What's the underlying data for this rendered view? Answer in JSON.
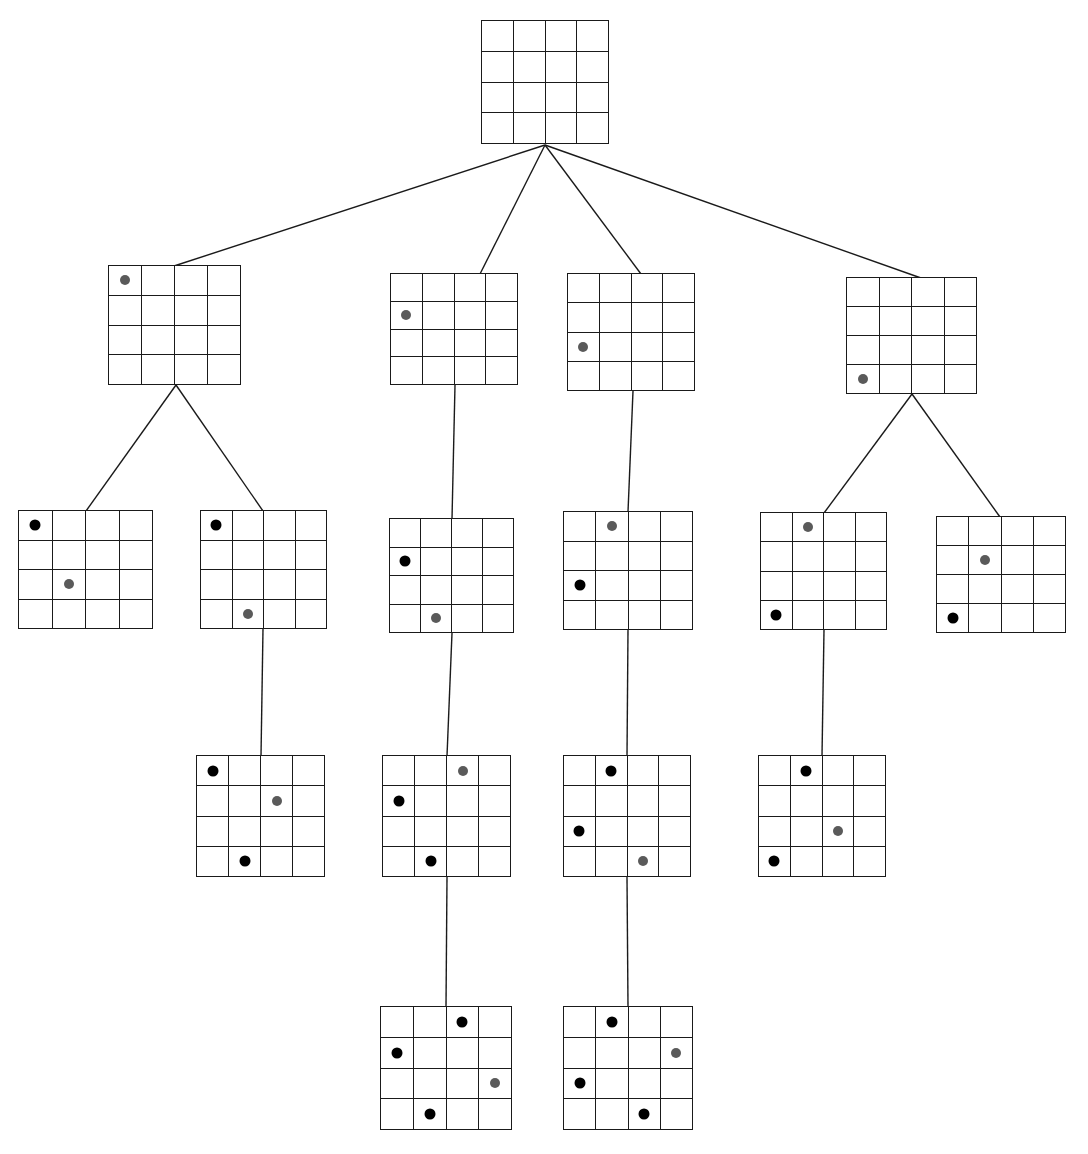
{
  "diagram": {
    "board_rows": 4,
    "board_cols": 4,
    "colors": {
      "grid_line": "#1a1a1a",
      "background": "#ffffff",
      "edge_line": "#1a1a1a",
      "placed_piece": "#000000",
      "candidate_piece": "#5a5a5a"
    },
    "legend": {
      "placed_label": "placed piece",
      "candidate_label": "newly placed piece"
    }
  },
  "chart_data": {
    "type": "diagram",
    "levels": 5,
    "node_count": 17,
    "edge_count": 16
  },
  "nodes": [
    {
      "id": "root",
      "level": 0,
      "x": 481,
      "y": 20,
      "w": 128,
      "h": 124,
      "pieces": []
    },
    {
      "id": "L1-A",
      "level": 1,
      "x": 108,
      "y": 265,
      "w": 133,
      "h": 120,
      "pieces": [
        {
          "row": 1,
          "col": 1,
          "kind": "candidate"
        }
      ]
    },
    {
      "id": "L1-B",
      "level": 1,
      "x": 390,
      "y": 273,
      "w": 128,
      "h": 112,
      "pieces": [
        {
          "row": 2,
          "col": 1,
          "kind": "candidate"
        }
      ]
    },
    {
      "id": "L1-C",
      "level": 1,
      "x": 567,
      "y": 273,
      "w": 128,
      "h": 118,
      "pieces": [
        {
          "row": 3,
          "col": 1,
          "kind": "candidate"
        }
      ]
    },
    {
      "id": "L1-D",
      "level": 1,
      "x": 846,
      "y": 277,
      "w": 131,
      "h": 117,
      "pieces": [
        {
          "row": 4,
          "col": 1,
          "kind": "candidate"
        }
      ]
    },
    {
      "id": "L2-A",
      "level": 2,
      "x": 18,
      "y": 510,
      "w": 135,
      "h": 119,
      "pieces": [
        {
          "row": 1,
          "col": 1,
          "kind": "placed"
        },
        {
          "row": 3,
          "col": 2,
          "kind": "candidate"
        }
      ]
    },
    {
      "id": "L2-B",
      "level": 2,
      "x": 200,
      "y": 510,
      "w": 127,
      "h": 119,
      "pieces": [
        {
          "row": 1,
          "col": 1,
          "kind": "placed"
        },
        {
          "row": 4,
          "col": 2,
          "kind": "candidate"
        }
      ]
    },
    {
      "id": "L2-C",
      "level": 2,
      "x": 389,
      "y": 518,
      "w": 125,
      "h": 115,
      "pieces": [
        {
          "row": 2,
          "col": 1,
          "kind": "placed"
        },
        {
          "row": 4,
          "col": 2,
          "kind": "candidate"
        }
      ]
    },
    {
      "id": "L2-D",
      "level": 2,
      "x": 563,
      "y": 511,
      "w": 130,
      "h": 119,
      "pieces": [
        {
          "row": 1,
          "col": 2,
          "kind": "candidate"
        },
        {
          "row": 3,
          "col": 1,
          "kind": "placed"
        }
      ]
    },
    {
      "id": "L2-E",
      "level": 2,
      "x": 760,
      "y": 512,
      "w": 127,
      "h": 118,
      "pieces": [
        {
          "row": 1,
          "col": 2,
          "kind": "candidate"
        },
        {
          "row": 4,
          "col": 1,
          "kind": "placed"
        }
      ]
    },
    {
      "id": "L2-F",
      "level": 2,
      "x": 936,
      "y": 516,
      "w": 130,
      "h": 117,
      "pieces": [
        {
          "row": 2,
          "col": 2,
          "kind": "candidate"
        },
        {
          "row": 4,
          "col": 1,
          "kind": "placed"
        }
      ]
    },
    {
      "id": "L3-A",
      "level": 3,
      "x": 196,
      "y": 755,
      "w": 129,
      "h": 122,
      "pieces": [
        {
          "row": 1,
          "col": 1,
          "kind": "placed"
        },
        {
          "row": 2,
          "col": 3,
          "kind": "candidate"
        },
        {
          "row": 4,
          "col": 2,
          "kind": "placed"
        }
      ]
    },
    {
      "id": "L3-B",
      "level": 3,
      "x": 382,
      "y": 755,
      "w": 129,
      "h": 122,
      "pieces": [
        {
          "row": 1,
          "col": 3,
          "kind": "candidate"
        },
        {
          "row": 2,
          "col": 1,
          "kind": "placed"
        },
        {
          "row": 4,
          "col": 2,
          "kind": "placed"
        }
      ]
    },
    {
      "id": "L3-C",
      "level": 3,
      "x": 563,
      "y": 755,
      "w": 128,
      "h": 122,
      "pieces": [
        {
          "row": 1,
          "col": 2,
          "kind": "placed"
        },
        {
          "row": 3,
          "col": 1,
          "kind": "placed"
        },
        {
          "row": 4,
          "col": 3,
          "kind": "candidate"
        }
      ]
    },
    {
      "id": "L3-D",
      "level": 3,
      "x": 758,
      "y": 755,
      "w": 128,
      "h": 122,
      "pieces": [
        {
          "row": 1,
          "col": 2,
          "kind": "placed"
        },
        {
          "row": 3,
          "col": 3,
          "kind": "candidate"
        },
        {
          "row": 4,
          "col": 1,
          "kind": "placed"
        }
      ]
    },
    {
      "id": "L4-A",
      "level": 4,
      "x": 380,
      "y": 1006,
      "w": 132,
      "h": 124,
      "pieces": [
        {
          "row": 1,
          "col": 3,
          "kind": "placed"
        },
        {
          "row": 2,
          "col": 1,
          "kind": "placed"
        },
        {
          "row": 3,
          "col": 4,
          "kind": "candidate"
        },
        {
          "row": 4,
          "col": 2,
          "kind": "placed"
        }
      ]
    },
    {
      "id": "L4-B",
      "level": 4,
      "x": 563,
      "y": 1006,
      "w": 130,
      "h": 124,
      "pieces": [
        {
          "row": 1,
          "col": 2,
          "kind": "placed"
        },
        {
          "row": 2,
          "col": 4,
          "kind": "candidate"
        },
        {
          "row": 3,
          "col": 1,
          "kind": "placed"
        },
        {
          "row": 4,
          "col": 3,
          "kind": "placed"
        }
      ]
    }
  ],
  "edges": [
    {
      "from": "root",
      "to": "L1-A",
      "x1": 545,
      "y1": 145,
      "x2": 174,
      "y2": 266
    },
    {
      "from": "root",
      "to": "L1-B",
      "x1": 545,
      "y1": 145,
      "x2": 480,
      "y2": 274
    },
    {
      "from": "root",
      "to": "L1-C",
      "x1": 545,
      "y1": 145,
      "x2": 641,
      "y2": 274
    },
    {
      "from": "root",
      "to": "L1-D",
      "x1": 545,
      "y1": 145,
      "x2": 921,
      "y2": 278
    },
    {
      "from": "L1-A",
      "to": "L2-A",
      "x1": 176,
      "y1": 385,
      "x2": 86,
      "y2": 511
    },
    {
      "from": "L1-A",
      "to": "L2-B",
      "x1": 176,
      "y1": 385,
      "x2": 263,
      "y2": 511
    },
    {
      "from": "L1-B",
      "to": "L2-C",
      "x1": 455,
      "y1": 385,
      "x2": 452,
      "y2": 519
    },
    {
      "from": "L1-C",
      "to": "L2-D",
      "x1": 633,
      "y1": 391,
      "x2": 628,
      "y2": 512
    },
    {
      "from": "L1-D",
      "to": "L2-E",
      "x1": 912,
      "y1": 394,
      "x2": 824,
      "y2": 513
    },
    {
      "from": "L1-D",
      "to": "L2-F",
      "x1": 912,
      "y1": 394,
      "x2": 1000,
      "y2": 517
    },
    {
      "from": "L2-B",
      "to": "L3-A",
      "x1": 263,
      "y1": 629,
      "x2": 261,
      "y2": 756
    },
    {
      "from": "L2-C",
      "to": "L3-B",
      "x1": 452,
      "y1": 633,
      "x2": 447,
      "y2": 756
    },
    {
      "from": "L2-D",
      "to": "L3-C",
      "x1": 628,
      "y1": 630,
      "x2": 627,
      "y2": 756
    },
    {
      "from": "L2-E",
      "to": "L3-D",
      "x1": 824,
      "y1": 630,
      "x2": 822,
      "y2": 756
    },
    {
      "from": "L3-B",
      "to": "L4-A",
      "x1": 447,
      "y1": 877,
      "x2": 446,
      "y2": 1007
    },
    {
      "from": "L3-C",
      "to": "L4-B",
      "x1": 627,
      "y1": 877,
      "x2": 628,
      "y2": 1007
    }
  ]
}
